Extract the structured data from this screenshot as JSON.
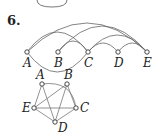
{
  "problem": {
    "number": "6."
  },
  "arc_graph": {
    "nodes": [
      {
        "id": "A",
        "label": "A",
        "x": 27,
        "y": 52
      },
      {
        "id": "B",
        "label": "B",
        "x": 58,
        "y": 52
      },
      {
        "id": "C",
        "label": "C",
        "x": 88,
        "y": 52
      },
      {
        "id": "D",
        "label": "D",
        "x": 118,
        "y": 52
      },
      {
        "id": "E",
        "label": "E",
        "x": 147,
        "y": 52
      }
    ],
    "edges": [
      [
        "A",
        "E"
      ],
      [
        "A",
        "C"
      ],
      [
        "A",
        "C",
        "below"
      ],
      [
        "B",
        "E"
      ],
      [
        "B",
        "C"
      ],
      [
        "C",
        "E"
      ],
      [
        "C",
        "D"
      ],
      [
        "D",
        "E"
      ]
    ]
  },
  "pentagon_graph": {
    "nodes": [
      {
        "id": "A",
        "label": "A",
        "x": 42,
        "y": 84
      },
      {
        "id": "B",
        "label": "B",
        "x": 67,
        "y": 84
      },
      {
        "id": "C",
        "label": "C",
        "x": 76,
        "y": 108
      },
      {
        "id": "D",
        "label": "D",
        "x": 55,
        "y": 122
      },
      {
        "id": "E",
        "label": "E",
        "x": 34,
        "y": 108
      }
    ],
    "edges": [
      [
        "A",
        "E"
      ],
      [
        "A",
        "D"
      ],
      [
        "A",
        "C"
      ],
      [
        "B",
        "E"
      ],
      [
        "B",
        "D"
      ],
      [
        "B",
        "C"
      ],
      [
        "E",
        "C"
      ],
      [
        "E",
        "D"
      ],
      [
        "D",
        "C"
      ]
    ]
  }
}
